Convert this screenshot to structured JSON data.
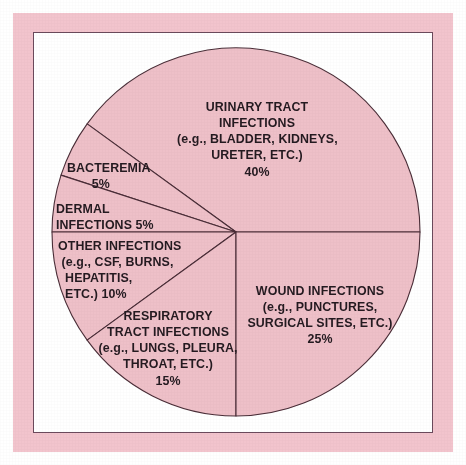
{
  "figure": {
    "frame_color": "#f2c4cd",
    "inner_frame_line_color": "#6b4a5c",
    "background": "#ffffff"
  },
  "chart_data": {
    "type": "pie",
    "title": "",
    "subtitle": "",
    "xlabel": "",
    "ylabel": "",
    "legend_position": "none",
    "grid": false,
    "units": "percent",
    "total": 100,
    "slice_fill_color": "#eec0c8",
    "slice_edge_color": "#4a2d37",
    "start_angle_deg": 0,
    "direction": "counterclockwise",
    "categories": [
      "URINARY TRACT INFECTIONS",
      "BACTEREMIA",
      "DERMAL INFECTIONS",
      "OTHER INFECTIONS",
      "RESPIRATORY TRACT INFECTIONS",
      "WOUND INFECTIONS"
    ],
    "values": [
      40,
      5,
      5,
      10,
      15,
      25
    ],
    "slices": [
      {
        "name": "URINARY TRACT INFECTIONS",
        "value": 40,
        "percent_label": "40%",
        "examples": "(e.g., BLADDER, KIDNEYS, URETER, ETC.)",
        "start_deg": 0,
        "end_deg": 144
      },
      {
        "name": "BACTEREMIA",
        "value": 5,
        "percent_label": "5%",
        "examples": "",
        "start_deg": 144,
        "end_deg": 162
      },
      {
        "name": "DERMAL INFECTIONS",
        "value": 5,
        "percent_label": "5%",
        "examples": "",
        "start_deg": 162,
        "end_deg": 180
      },
      {
        "name": "OTHER INFECTIONS",
        "value": 10,
        "percent_label": "10%",
        "examples": "(e.g., CSF, BURNS, HEPATITIS, ETC.)",
        "start_deg": 180,
        "end_deg": 216
      },
      {
        "name": "RESPIRATORY TRACT INFECTIONS",
        "value": 15,
        "percent_label": "15%",
        "examples": "(e.g., LUNGS, PLEURA, THROAT, ETC.)",
        "start_deg": 216,
        "end_deg": 270
      },
      {
        "name": "WOUND INFECTIONS",
        "value": 25,
        "percent_label": "25%",
        "examples": "(e.g., PUNCTURES, SURGICAL SITES, ETC.)",
        "start_deg": 270,
        "end_deg": 360
      }
    ]
  },
  "labels": {
    "urinary": "URINARY TRACT\nINFECTIONS\n(e.g., BLADDER, KIDNEYS,\nURETER, ETC.)\n40%",
    "wound": "WOUND INFECTIONS\n(e.g., PUNCTURES,\nSURGICAL SITES, ETC.)\n25%",
    "respiratory": "RESPIRATORY\nTRACT INFECTIONS\n(e.g., LUNGS, PLEURA,\nTHROAT, ETC.)\n15%",
    "other": "OTHER INFECTIONS\n (e.g., CSF, BURNS,\n  HEPATITIS,\n  ETC.) 10%",
    "dermal": "DERMAL\nINFECTIONS 5%",
    "bacteremia": "BACTEREMIA\n       5%"
  }
}
